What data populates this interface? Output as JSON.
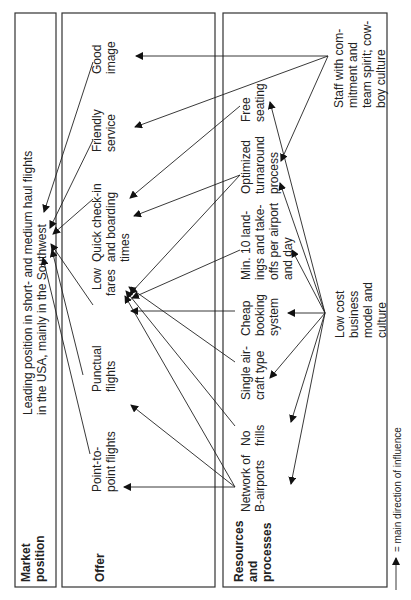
{
  "rows": {
    "market_position": {
      "label": [
        "Market",
        "position"
      ]
    },
    "offer": {
      "label": [
        "Offer"
      ]
    },
    "resources": {
      "label": [
        "Resources",
        "and",
        "processes"
      ]
    }
  },
  "market_position_text": [
    "Leading position in short- and medium haul flights",
    "in the USA, mainly in the Southwest"
  ],
  "offer_items": [
    {
      "id": "point-to-point",
      "lines": [
        "Point-to-",
        "point flights"
      ]
    },
    {
      "id": "punctual",
      "lines": [
        "Punctual",
        "flights"
      ]
    },
    {
      "id": "low-fares",
      "lines": [
        "Low",
        "fares"
      ]
    },
    {
      "id": "quick-checkin",
      "lines": [
        "Quick check-in",
        "and boarding",
        "times"
      ]
    },
    {
      "id": "friendly",
      "lines": [
        "Friendly",
        "service"
      ]
    },
    {
      "id": "good-image",
      "lines": [
        "Good",
        "image"
      ]
    }
  ],
  "resource_items": [
    {
      "id": "b-airports",
      "lines": [
        "Network of",
        "B-airports"
      ]
    },
    {
      "id": "no-frills",
      "lines": [
        "No",
        "frills"
      ]
    },
    {
      "id": "single-aircraft",
      "lines": [
        "Single air-",
        "craft type"
      ]
    },
    {
      "id": "cheap-booking",
      "lines": [
        "Cheap",
        "booking",
        "system"
      ]
    },
    {
      "id": "min-landings",
      "lines": [
        "Min. 10 land-",
        "ings and take-",
        "offs per airport",
        "and day"
      ]
    },
    {
      "id": "turnaround",
      "lines": [
        "Optimized",
        "turnaround",
        "process"
      ]
    },
    {
      "id": "free-seating",
      "lines": [
        "Free",
        "seating"
      ]
    }
  ],
  "drivers": [
    {
      "id": "low-cost",
      "lines": [
        "Low cost",
        "business",
        "model and",
        "culture"
      ]
    },
    {
      "id": "staff",
      "lines": [
        "Staff with com-",
        "mitment and",
        "team spirit; cow-",
        "boy culture"
      ]
    }
  ],
  "legend": {
    "text": "= main direction of influence"
  }
}
